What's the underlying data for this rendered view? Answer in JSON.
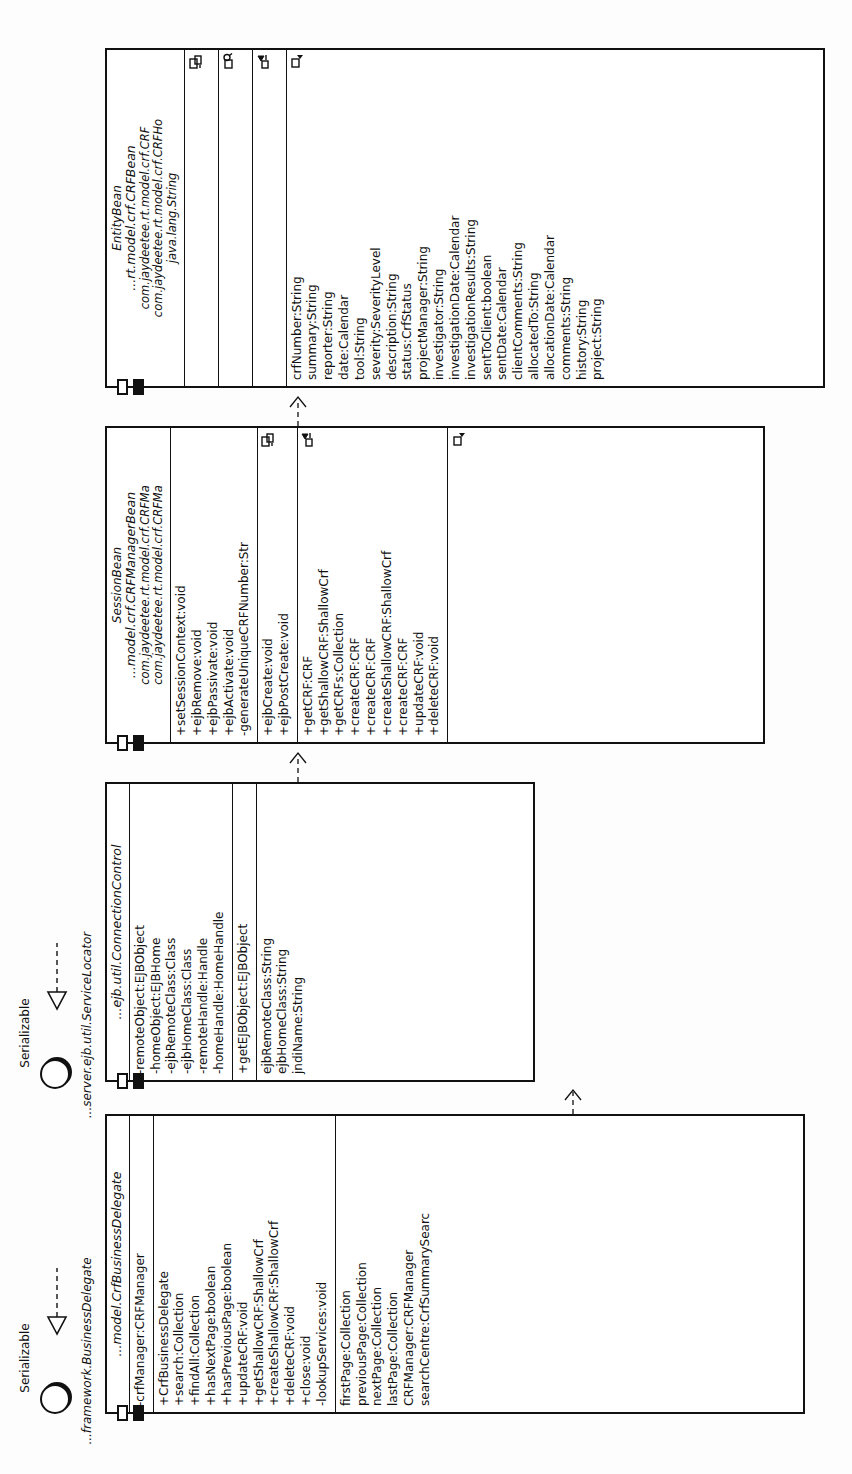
{
  "diagram": {
    "kind": "uml-class-diagram",
    "orientation": "rotated-90-ccw",
    "background": "#fdfdfd",
    "stroke": "#111111"
  },
  "interfaces": [
    {
      "id": "iface-businessdelegate",
      "name": "Serializable",
      "qualified": "...framework.BusinessDelegate",
      "icon": "lollipop-icon"
    },
    {
      "id": "iface-servicelocator",
      "name": "Serializable",
      "qualified": "...server.ejb.util.ServiceLocator",
      "icon": "lollipop-icon"
    }
  ],
  "classes": [
    {
      "id": "crf-business-delegate",
      "stereotype": "",
      "name": "...model.CrfBusinessDelegate",
      "qualifiers": [],
      "compartments": [
        {
          "id": "attrs",
          "badge": "",
          "members": [
            "-crfManager:CRFManager"
          ]
        },
        {
          "id": "ops",
          "badge": "",
          "members": [
            "+CrfBusinessDelegate",
            "+search:Collection",
            "+findAll:Collection",
            "+hasNextPage:boolean",
            "+hasPreviousPage:boolean",
            "+updateCRF:void",
            "+getShallowCRF:ShallowCrf",
            "+createShallowCRF:ShallowCrf",
            "+deleteCRF:void",
            "+close:void",
            "-lookupServices:void"
          ]
        },
        {
          "id": "extras",
          "badge": "",
          "members": [
            "firstPage:Collection",
            "previousPage:Collection",
            "nextPage:Collection",
            "lastPage:Collection",
            "CRFManager:CRFManager",
            "searchCentre:CrfSummarySearc"
          ]
        }
      ]
    },
    {
      "id": "connection-control",
      "stereotype": "",
      "name": "...ejb.util.ConnectionControl",
      "qualifiers": [],
      "compartments": [
        {
          "id": "attrs",
          "badge": "",
          "members": [
            "-remoteObject:EJBObject",
            "-homeObject:EJBHome",
            "-ejbRemoteClass:Class",
            "-ejbHomeClass:Class",
            "-remoteHandle:Handle",
            "-homeHandle:HomeHandle"
          ]
        },
        {
          "id": "ops",
          "badge": "",
          "members": [
            "+getEJBObject:EJBObject"
          ]
        },
        {
          "id": "extras",
          "badge": "",
          "members": [
            "ejbRemoteClass:String",
            "ejbHomeClass:String",
            "jndiName:String"
          ]
        }
      ]
    },
    {
      "id": "crf-manager-bean",
      "stereotype": "SessionBean",
      "name": "...model.crf.CRFManagerBean",
      "qualifiers": [
        "com.jaydeetee.rt.model.crf.CRFMa",
        "com.jaydeetee.rt.model.crf.CRFMa"
      ],
      "compartments": [
        {
          "id": "ops-lifecycle",
          "badge": "",
          "members": [
            "+setSessionContext:void",
            "+ejbRemove:void",
            "+ejbPassivate:void",
            "+ejbActivate:void",
            "-generateUniqueCRFNumber:Str"
          ]
        },
        {
          "id": "ops-create",
          "badge": "ejb-create-icon",
          "members": [
            "+ejbCreate:void",
            "+ejbPostCreate:void"
          ]
        },
        {
          "id": "ops-business",
          "badge": "ejb-business-icon",
          "members": [
            "+getCRF:CRF",
            "+getShallowCRF:ShallowCrf",
            "+getCRFs:Collection",
            "+createCRF:CRF",
            "+createCRF:CRF",
            "+createShallowCRF:ShallowCrf",
            "+createCRF:CRF",
            "+updateCRF:void",
            "+deleteCRF:void"
          ]
        },
        {
          "id": "ops-tail",
          "badge": "ejb-tail-icon",
          "members": []
        }
      ]
    },
    {
      "id": "crf-bean",
      "stereotype": "EntityBean",
      "name": "...rt.model.crf.CRFBean",
      "qualifiers": [
        "com.jaydeetee.rt.model.crf.CRF",
        "com.jaydeetee.rt.model.crf.CRFHo",
        "java.lang.String"
      ],
      "compartments": [
        {
          "id": "c1",
          "badge": "ejb-create-icon",
          "members": []
        },
        {
          "id": "c2",
          "badge": "ejb-finder-icon",
          "members": []
        },
        {
          "id": "c3",
          "badge": "ejb-business-icon",
          "members": []
        },
        {
          "id": "attrs",
          "badge": "ejb-tail-icon",
          "members": [
            "crfNumber:String",
            "summary:String",
            "reporter:String",
            "date:Calendar",
            "tool:String",
            "severity:SeverityLevel",
            "description:String",
            "status:CrfStatus",
            "projectManager:String",
            "investigator:String",
            "investigationDate:Calendar",
            "investigationResults:String",
            "sentToClient:boolean",
            "sentDate:Calendar",
            "clientComments:String",
            "allocatedTo:String",
            "allocationDate:Calendar",
            "comments:String",
            "history:String",
            "project:String"
          ]
        }
      ]
    }
  ],
  "relationships": [
    {
      "id": "r1",
      "type": "realization",
      "from": "crf-business-delegate",
      "to": "iface-businessdelegate",
      "glyph": "hollow-triangle-icon"
    },
    {
      "id": "r2",
      "type": "realization",
      "from": "connection-control",
      "to": "iface-servicelocator",
      "glyph": "hollow-triangle-icon"
    },
    {
      "id": "r3",
      "type": "dependency",
      "from": "crf-business-delegate",
      "to": "connection-control",
      "glyph": "dashed-arrow-icon"
    },
    {
      "id": "r4",
      "type": "dependency",
      "from": "connection-control",
      "to": "crf-manager-bean",
      "glyph": "dashed-arrow-icon"
    },
    {
      "id": "r5",
      "type": "dependency",
      "from": "crf-manager-bean",
      "to": "crf-bean",
      "glyph": "dashed-arrow-icon"
    }
  ]
}
